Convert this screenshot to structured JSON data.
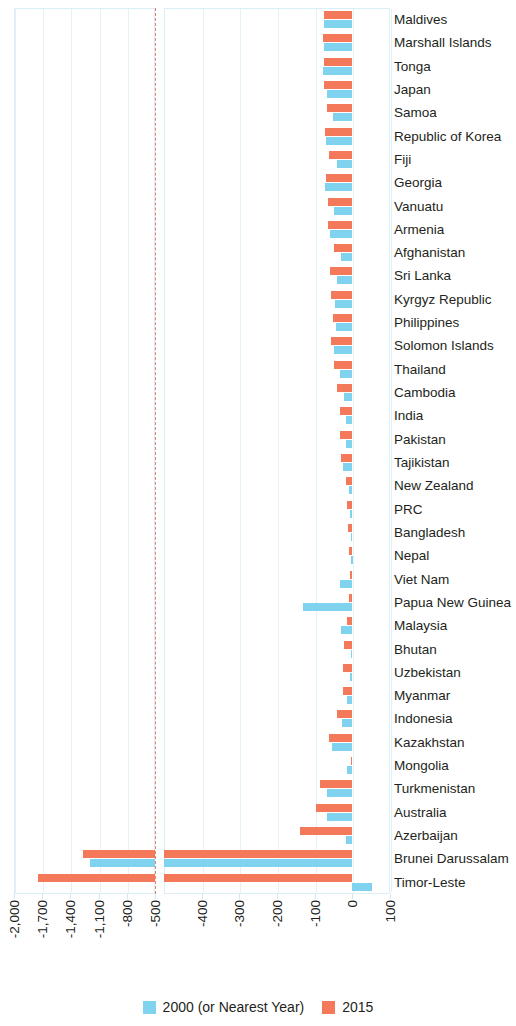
{
  "chart_data": {
    "type": "bar",
    "orientation": "horizontal",
    "title": "",
    "subtitle": "",
    "xlabel": "",
    "ylabel": "",
    "grid": true,
    "legend_position": "bottom",
    "axis_break": {
      "present": true,
      "break_value": -500,
      "note": "X axis is broken: the left segment compresses -2,000 to -500; the right segment runs -500 to 100 in 100-unit steps."
    },
    "xlim": [
      -2000,
      100
    ],
    "xticks": [
      -2000,
      -1700,
      -1400,
      -1100,
      -800,
      -500,
      -400,
      -300,
      -200,
      -100,
      0,
      100
    ],
    "xticklabels": [
      "-2,000",
      "-1,700",
      "-1,400",
      "-1,100",
      "-800",
      "-500",
      "-400",
      "-300",
      "-200",
      "-100",
      "0",
      "100"
    ],
    "categories": [
      "Maldives",
      "Marshall Islands",
      "Tonga",
      "Japan",
      "Samoa",
      "Republic of Korea",
      "Fiji",
      "Georgia",
      "Vanuatu",
      "Armenia",
      "Afghanistan",
      "Sri Lanka",
      "Kyrgyz Republic",
      "Philippines",
      "Solomon Islands",
      "Thailand",
      "Cambodia",
      "India",
      "Pakistan",
      "Tajikistan",
      "New Zealand",
      "PRC",
      "Bangladesh",
      "Nepal",
      "Viet Nam",
      "Papua New Guinea",
      "Malaysia",
      "Bhutan",
      "Uzbekistan",
      "Myanmar",
      "Indonesia",
      "Kazakhstan",
      "Mongolia",
      "Turkmenistan",
      "Australia",
      "Azerbaijan",
      "Brunei Darussalam",
      "Timor-Leste"
    ],
    "series": [
      {
        "name": "2000 (or Nearest Year)",
        "color": "#7fd3ef",
        "values": [
          -74,
          -76,
          -78,
          -66,
          -52,
          -70,
          -42,
          -72,
          -50,
          -60,
          -30,
          -40,
          -46,
          -44,
          -48,
          -34,
          -22,
          -18,
          -16,
          -24,
          -8,
          -6,
          -4,
          -3,
          -34,
          -131,
          -30,
          -4,
          -6,
          -14,
          -28,
          -54,
          -14,
          -68,
          -66,
          -18,
          -1190,
          52
        ]
      },
      {
        "name": "2015",
        "color": "#f4795a",
        "values": [
          -74,
          -78,
          -76,
          -74,
          -66,
          -72,
          -62,
          -70,
          -64,
          -64,
          -48,
          -58,
          -56,
          -52,
          -56,
          -48,
          -40,
          -34,
          -32,
          -30,
          -16,
          -14,
          -12,
          -10,
          -6,
          -10,
          -14,
          -22,
          -24,
          -26,
          -40,
          -62,
          -4,
          -86,
          -96,
          -140,
          -1270,
          -1750
        ]
      }
    ]
  },
  "legend": {
    "items": [
      {
        "label": "2000 (or Nearest Year)",
        "color": "#7fd3ef",
        "swatch": "legend-swatch-2000"
      },
      {
        "label": "2015",
        "color": "#f4795a",
        "swatch": "legend-swatch-2015"
      }
    ]
  },
  "colors": {
    "series_2000": "#7fd3ef",
    "series_2015": "#f4795a",
    "grid": "#e3f2f9",
    "panel_border": "#d9eef6",
    "break_line": "#e8806a",
    "text": "#231f20"
  }
}
